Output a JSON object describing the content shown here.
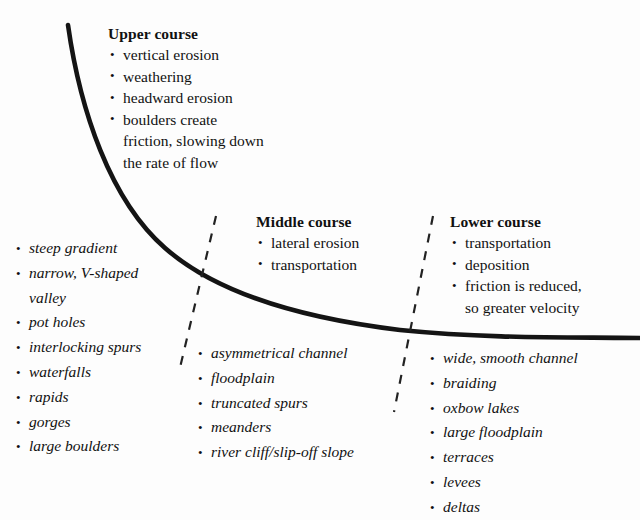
{
  "diagram": {
    "background_color": "#fdfdfd",
    "line_color": "#111111"
  },
  "courses": [
    {
      "id": "upper",
      "heading": "Upper course",
      "processes": [
        "vertical erosion",
        "weathering",
        "headward erosion",
        "boulders create"
      ],
      "process_continuations": [
        "friction, slowing down",
        "the rate of flow"
      ],
      "features": [
        "steep gradient",
        "narrow, V-shaped",
        "pot holes",
        "interlocking spurs",
        "waterfalls",
        "rapids",
        "gorges",
        "large boulders"
      ],
      "feature_continuation": "valley"
    },
    {
      "id": "middle",
      "heading": "Middle course",
      "processes": [
        "lateral erosion",
        "transportation"
      ],
      "features": [
        "asymmetrical channel",
        "floodplain",
        "truncated spurs",
        "meanders",
        "river cliff/slip-off slope"
      ]
    },
    {
      "id": "lower",
      "heading": "Lower course",
      "processes": [
        "transportation",
        "deposition",
        "friction is reduced,"
      ],
      "process_continuations": [
        "so greater velocity"
      ],
      "features": [
        "wide, smooth channel",
        "braiding",
        "oxbow lakes",
        "large floodplain",
        "terraces",
        "levees",
        "deltas"
      ]
    }
  ]
}
